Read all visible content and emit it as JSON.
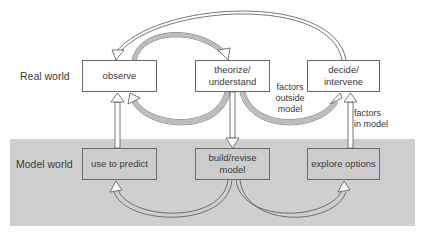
{
  "rows": {
    "real": {
      "label": "Real world"
    },
    "model": {
      "label": "Model world"
    }
  },
  "nodes": {
    "observe": {
      "label": "observe"
    },
    "theorize": {
      "line1": "theorize/",
      "line2": "understand"
    },
    "decide": {
      "line1": "decide/",
      "line2": "intervene"
    },
    "predict": {
      "label": "use to predict"
    },
    "build": {
      "line1": "build/revise",
      "line2": "model"
    },
    "explore": {
      "label": "explore options"
    }
  },
  "annotations": {
    "outside": {
      "line1": "factors",
      "line2": "outside",
      "line3": "model"
    },
    "inside": {
      "line1": "factors",
      "line2": "in model"
    }
  },
  "colors": {
    "band": "#cfcfcf",
    "box_border": "#6a6a6a",
    "arrow_stroke": "#555555",
    "arrow_fill_shade": "#bdbdbd"
  }
}
